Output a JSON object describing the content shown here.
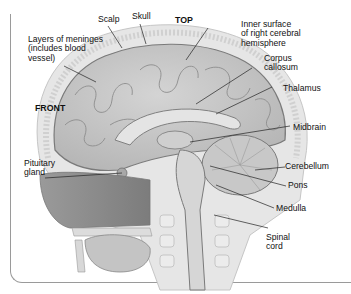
{
  "diagram": {
    "orientation_labels": {
      "top": "TOP",
      "front": "FRONT"
    },
    "labels": [
      {
        "id": "scalp",
        "text": "Scalp"
      },
      {
        "id": "skull",
        "text": "Skull"
      },
      {
        "id": "meninges",
        "text": "Layers of meninges\n(includes blood\nvessel)"
      },
      {
        "id": "inner-surface",
        "text": "Inner surface\nof right cerebral\nhemisphere"
      },
      {
        "id": "corpus-callosum",
        "text": "Corpus\ncallosum"
      },
      {
        "id": "thalamus",
        "text": "Thalamus"
      },
      {
        "id": "midbrain",
        "text": "Midbrain"
      },
      {
        "id": "pituitary",
        "text": "Pituitary\ngland"
      },
      {
        "id": "cerebellum",
        "text": "Cerebellum"
      },
      {
        "id": "pons",
        "text": "Pons"
      },
      {
        "id": "medulla",
        "text": "Medulla"
      },
      {
        "id": "spinal-cord",
        "text": "Spinal\ncord"
      }
    ]
  }
}
